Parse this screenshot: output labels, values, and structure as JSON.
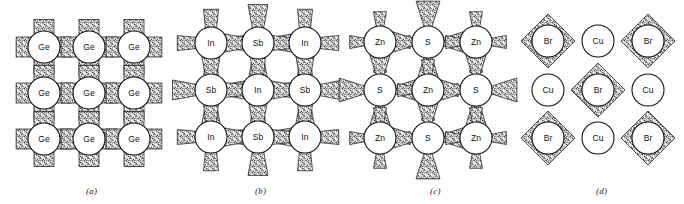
{
  "figure": {
    "type": "crystal-bonding-diagrams",
    "width": 684,
    "height": 204,
    "background": "#ffffff",
    "ink": "#111111",
    "stipple_fill": "#9a9a9a"
  },
  "panels": [
    {
      "id": "a",
      "caption": "(a)",
      "caption_x": 86,
      "caption_y": 186,
      "origin_x": 14,
      "origin_y": 6,
      "bond_style": "rectangular-band",
      "bond_note": "uniform wide stippled bands between all neighbours (pure covalent)",
      "circle_radius": 16,
      "spacing_x": 45,
      "spacing_y": 46,
      "cols": 3,
      "rows": 3,
      "col_centers": [
        44,
        89,
        134
      ],
      "row_centers": [
        47,
        93,
        139
      ],
      "lattice": [
        [
          "Ge",
          "Ge",
          "Ge"
        ],
        [
          "Ge",
          "Ge",
          "Ge"
        ],
        [
          "Ge",
          "Ge",
          "Ge"
        ]
      ],
      "species": [
        "Ge"
      ]
    },
    {
      "id": "b",
      "caption": "(b)",
      "caption_x": 255,
      "caption_y": 186,
      "origin_x": 188,
      "origin_y": 6,
      "bond_style": "bowtie-wedge",
      "bond_note": "paired triangular wedges, slightly wider toward Sb (weakly ionic)",
      "circle_radius": 16,
      "spacing_x": 47,
      "spacing_y": 47,
      "cols": 3,
      "rows": 3,
      "col_centers": [
        211,
        258,
        305
      ],
      "row_centers": [
        43,
        90,
        137
      ],
      "lattice": [
        [
          "In",
          "Sb",
          "In"
        ],
        [
          "Sb",
          "In",
          "Sb"
        ],
        [
          "In",
          "Sb",
          "In"
        ]
      ],
      "species": [
        "In",
        "Sb"
      ]
    },
    {
      "id": "c",
      "caption": "(c)",
      "caption_x": 430,
      "caption_y": 186,
      "origin_x": 356,
      "origin_y": 6,
      "bond_style": "asymmetric-wedge",
      "bond_note": "triangular wedges broad at the S side, tapering toward Zn (strongly ionic)",
      "circle_radius": 16,
      "spacing_x": 48,
      "spacing_y": 48,
      "cols": 3,
      "rows": 3,
      "col_centers": [
        380,
        428,
        476
      ],
      "row_centers": [
        42,
        90,
        138
      ],
      "lattice": [
        [
          "Zn",
          "S",
          "Zn"
        ],
        [
          "S",
          "Zn",
          "S"
        ],
        [
          "Zn",
          "S",
          "Zn"
        ]
      ],
      "species": [
        "Zn",
        "S"
      ]
    },
    {
      "id": "d",
      "caption": "(d)",
      "caption_x": 596,
      "caption_y": 186,
      "origin_x": 520,
      "origin_y": 6,
      "bond_style": "diamond-shell",
      "bond_note": "stippled diamond shells enclose Br only; Cu circles bare (nearly fully ionic)",
      "circle_radius": 16,
      "spacing_x": 50,
      "spacing_y": 49,
      "cols": 3,
      "rows": 3,
      "col_centers": [
        548,
        598,
        648
      ],
      "row_centers": [
        41,
        90,
        138
      ],
      "lattice": [
        [
          "Br",
          "Cu",
          "Br"
        ],
        [
          "Cu",
          "Br",
          "Cu"
        ],
        [
          "Br",
          "Cu",
          "Br"
        ]
      ],
      "species": [
        "Br",
        "Cu"
      ],
      "shelled_species": "Br"
    }
  ]
}
